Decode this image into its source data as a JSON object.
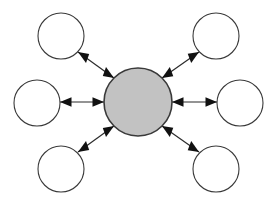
{
  "diagram": {
    "type": "hub-and-spoke",
    "title": "",
    "canvas": {
      "width": 279,
      "height": 204,
      "background": "#ffffff"
    },
    "style": {
      "hub_fill": "#c2c2c2",
      "hub_stroke": "#3a3a3a",
      "hub_stroke_width": 1.6,
      "satellite_fill": "#ffffff",
      "satellite_stroke": "#3a3a3a",
      "satellite_stroke_width": 1.1,
      "edge_stroke": "#2b2b2b",
      "edge_stroke_width": 1.2,
      "arrowhead_fill": "#111111"
    },
    "hub": {
      "id": "hub",
      "label": "",
      "cx": 138,
      "cy": 102,
      "r": 34,
      "fill": "#c2c2c2",
      "stroke": "#3a3a3a"
    },
    "satellites": [
      {
        "id": "node-top-left",
        "label": "",
        "cx": 61,
        "cy": 36,
        "r": 23,
        "fill": "#ffffff",
        "stroke": "#3a3a3a"
      },
      {
        "id": "node-top-right",
        "label": "",
        "cx": 216,
        "cy": 36,
        "r": 23,
        "fill": "#ffffff",
        "stroke": "#3a3a3a"
      },
      {
        "id": "node-left",
        "label": "",
        "cx": 37,
        "cy": 103,
        "r": 23,
        "fill": "#ffffff",
        "stroke": "#3a3a3a"
      },
      {
        "id": "node-right",
        "label": "",
        "cx": 240,
        "cy": 103,
        "r": 23,
        "fill": "#ffffff",
        "stroke": "#3a3a3a"
      },
      {
        "id": "node-bottom-left",
        "label": "",
        "cx": 61,
        "cy": 169,
        "r": 23,
        "fill": "#ffffff",
        "stroke": "#3a3a3a"
      },
      {
        "id": "node-bottom-right",
        "label": "",
        "cx": 216,
        "cy": 169,
        "r": 23,
        "fill": "#ffffff",
        "stroke": "#3a3a3a"
      }
    ],
    "edges": [
      {
        "id": "edge-hub-top-left",
        "from": "hub",
        "to": "node-top-left",
        "direction": "bidirectional",
        "label": "",
        "x1": 114,
        "y1": 78,
        "x2": 78,
        "y2": 52
      },
      {
        "id": "edge-hub-top-right",
        "from": "hub",
        "to": "node-top-right",
        "direction": "bidirectional",
        "label": "",
        "x1": 162,
        "y1": 78,
        "x2": 199,
        "y2": 52
      },
      {
        "id": "edge-hub-left",
        "from": "hub",
        "to": "node-left",
        "direction": "bidirectional",
        "label": "",
        "x1": 104,
        "y1": 102,
        "x2": 60,
        "y2": 102
      },
      {
        "id": "edge-hub-right",
        "from": "hub",
        "to": "node-right",
        "direction": "bidirectional",
        "label": "",
        "x1": 172,
        "y1": 102,
        "x2": 217,
        "y2": 102
      },
      {
        "id": "edge-hub-bottom-left",
        "from": "hub",
        "to": "node-bottom-left",
        "direction": "bidirectional",
        "label": "",
        "x1": 114,
        "y1": 126,
        "x2": 78,
        "y2": 152
      },
      {
        "id": "edge-hub-bottom-right",
        "from": "hub",
        "to": "node-bottom-right",
        "direction": "bidirectional",
        "label": "",
        "x1": 162,
        "y1": 126,
        "x2": 199,
        "y2": 152
      }
    ]
  }
}
